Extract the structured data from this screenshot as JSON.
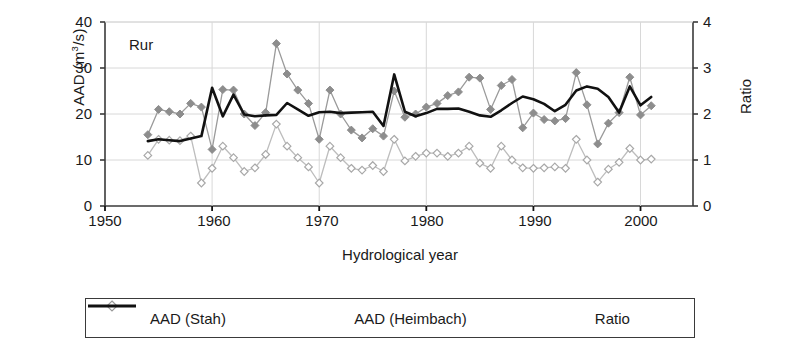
{
  "figure": {
    "annotation": "Rur",
    "xlabel": "Hydrological year",
    "ylabel_left": "AAD (m",
    "ylabel_left_sup": "3",
    "ylabel_left_tail": "/s)",
    "ylabel_right": "Ratio"
  },
  "axes": {
    "y_left_ticks": [
      "0",
      "10",
      "20",
      "30",
      "40"
    ],
    "y_right_ticks": [
      "0",
      "1",
      "2",
      "3",
      "4"
    ],
    "x_ticks": [
      "1950",
      "1960",
      "1970",
      "1980",
      "1990",
      "2000"
    ]
  },
  "legend": {
    "items": [
      {
        "label": "AAD (Stah)",
        "marker": "filled-diamond",
        "color": "#9a9a9a"
      },
      {
        "label": "AAD (Heimbach)",
        "marker": "open-diamond",
        "color": "#b5b5b5"
      },
      {
        "label": "Ratio",
        "marker": "line",
        "color": "#111111"
      }
    ]
  },
  "colors": {
    "stah": "#9a9a9a",
    "heimbach": "#bdbdbd",
    "ratio": "#111111",
    "grid": "#d8d8d8",
    "axis": "#3a3a3a"
  },
  "chart_data": {
    "type": "line",
    "title": "Rur",
    "xlabel": "Hydrological year",
    "ylabel": "AAD (m3/s)",
    "ylabel_secondary": "Ratio",
    "xlim": [
      1950,
      2004.9
    ],
    "ylim": [
      0,
      40
    ],
    "ylim_secondary": [
      0,
      4
    ],
    "grid": true,
    "legend_position": "bottom",
    "x": [
      1954,
      1955,
      1956,
      1957,
      1958,
      1959,
      1960,
      1961,
      1962,
      1963,
      1964,
      1965,
      1966,
      1967,
      1968,
      1969,
      1970,
      1971,
      1972,
      1973,
      1974,
      1975,
      1976,
      1977,
      1978,
      1979,
      1980,
      1981,
      1982,
      1983,
      1984,
      1985,
      1986,
      1987,
      1988,
      1989,
      1990,
      1991,
      1992,
      1993,
      1994,
      1995,
      1996,
      1997,
      1998,
      1999,
      2000,
      2001
    ],
    "series": [
      {
        "name": "AAD (Stah)",
        "axis": "left",
        "marker": "filled-diamond",
        "color": "#9a9a9a",
        "values": [
          15.5,
          21.0,
          20.5,
          20.0,
          22.3,
          21.5,
          12.3,
          25.3,
          25.2,
          20.0,
          17.5,
          20.3,
          35.3,
          28.7,
          25.2,
          22.3,
          14.5,
          25.2,
          20.0,
          16.5,
          14.8,
          16.8,
          15.2,
          25.0,
          19.3,
          20.0,
          21.5,
          22.3,
          24.0,
          24.8,
          28.0,
          27.8,
          21.0,
          26.2,
          27.5,
          17.0,
          20.2,
          18.8,
          18.5,
          19.0,
          29.0,
          22.0,
          13.5,
          18.0,
          20.3,
          28.0,
          19.8,
          21.8
        ]
      },
      {
        "name": "AAD (Heimbach)",
        "axis": "left",
        "marker": "open-diamond",
        "color": "#bdbdbd",
        "values": [
          11.0,
          14.5,
          14.3,
          14.2,
          15.2,
          5.0,
          8.2,
          13.0,
          10.5,
          7.5,
          8.3,
          11.2,
          17.8,
          13.0,
          10.5,
          8.5,
          5.0,
          13.0,
          10.5,
          8.2,
          7.8,
          8.8,
          7.5,
          14.5,
          9.8,
          10.8,
          11.5,
          11.5,
          10.8,
          11.5,
          13.0,
          9.3,
          8.2,
          13.0,
          10.0,
          8.3,
          8.2,
          8.3,
          8.5,
          8.2,
          14.5,
          10.0,
          5.2,
          8.0,
          9.5,
          12.5,
          10.0,
          10.2
        ]
      },
      {
        "name": "Ratio",
        "axis": "right",
        "marker": "line",
        "color": "#111111",
        "values": [
          1.41,
          1.45,
          1.43,
          1.41,
          1.47,
          1.52,
          2.57,
          1.95,
          2.42,
          1.99,
          1.95,
          1.97,
          1.98,
          2.24,
          2.1,
          1.96,
          2.04,
          2.05,
          2.02,
          2.03,
          2.04,
          2.05,
          1.74,
          2.86,
          2.05,
          1.95,
          2.02,
          2.11,
          2.11,
          2.12,
          2.05,
          1.97,
          1.94,
          2.08,
          2.24,
          2.38,
          2.32,
          2.22,
          2.06,
          2.2,
          2.51,
          2.6,
          2.55,
          2.37,
          2.03,
          2.6,
          2.19,
          2.37
        ]
      }
    ]
  }
}
